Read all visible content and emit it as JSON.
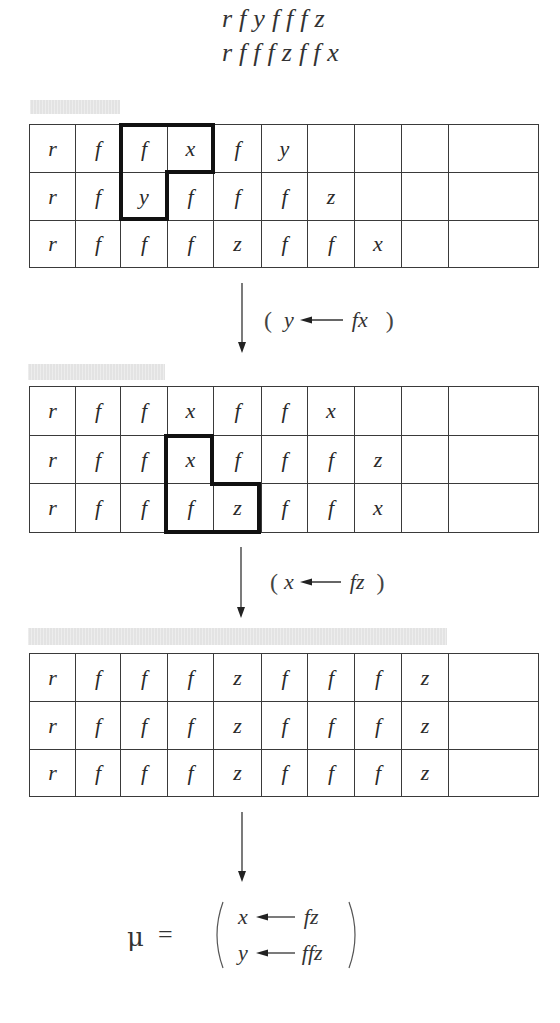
{
  "header": {
    "lines": [
      "rfyfffz",
      "rfffzffx"
    ]
  },
  "tables": [
    {
      "rows": [
        [
          "r",
          "f",
          "f",
          "x",
          "f",
          "y",
          "",
          "",
          "",
          ""
        ],
        [
          "r",
          "f",
          "y",
          "f",
          "f",
          "f",
          "z",
          "",
          "",
          ""
        ],
        [
          "r",
          "f",
          "f",
          "f",
          "z",
          "f",
          "f",
          "x",
          "",
          ""
        ]
      ],
      "highlight_cells": [
        [
          0,
          2
        ],
        [
          0,
          3
        ],
        [
          1,
          2
        ]
      ]
    },
    {
      "rows": [
        [
          "r",
          "f",
          "f",
          "x",
          "f",
          "f",
          "x",
          "",
          "",
          ""
        ],
        [
          "r",
          "f",
          "f",
          "x",
          "f",
          "f",
          "f",
          "z",
          "",
          ""
        ],
        [
          "r",
          "f",
          "f",
          "f",
          "z",
          "f",
          "f",
          "x",
          "",
          ""
        ]
      ],
      "highlight_cells": [
        [
          1,
          3
        ],
        [
          2,
          3
        ],
        [
          2,
          4
        ]
      ]
    },
    {
      "rows": [
        [
          "r",
          "f",
          "f",
          "f",
          "z",
          "f",
          "f",
          "f",
          "z",
          ""
        ],
        [
          "r",
          "f",
          "f",
          "f",
          "z",
          "f",
          "f",
          "f",
          "z",
          ""
        ],
        [
          "r",
          "f",
          "f",
          "f",
          "z",
          "f",
          "f",
          "f",
          "z",
          ""
        ]
      ],
      "highlight_cells": []
    }
  ],
  "transitions": [
    {
      "open": "(",
      "var": "y",
      "term": "fx",
      "close": ")"
    },
    {
      "open": "(",
      "var": "x",
      "term": "fz",
      "close": ")"
    }
  ],
  "result": {
    "symbol": "μ",
    "equals": "=",
    "substitution": [
      {
        "var": "x",
        "term": "fz"
      },
      {
        "var": "y",
        "term": "ffz"
      }
    ]
  },
  "icons": {
    "step_arrow": "down-arrow",
    "assign_arrow": "left-arrow"
  },
  "colors": {
    "grid": "#3a3a3a",
    "highlight": "#111111",
    "bar": "#e3e3e3"
  }
}
